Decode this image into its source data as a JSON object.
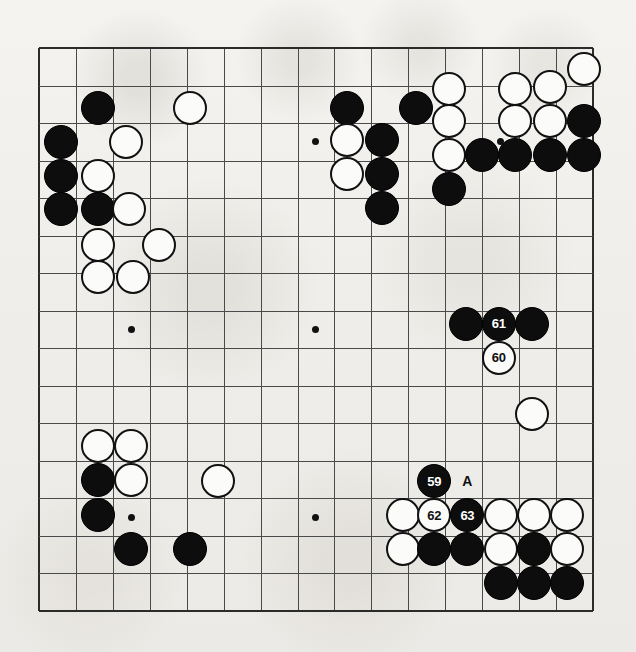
{
  "diagram": {
    "kind": "go-board-diagram",
    "board": {
      "cols": 16,
      "rows": 16,
      "origin_x": 39,
      "origin_y": 48,
      "step_x": 36.93,
      "step_y": 37.53,
      "stone_radius": 17,
      "line_color": "#4a4a4a",
      "edge_color": "#2b2b2b",
      "background": "#f2f1ee",
      "edges": {
        "left": true,
        "top": true,
        "right": true,
        "bottom": true
      }
    },
    "hoshi": [
      {
        "c": 2.5,
        "r": 2.5
      },
      {
        "c": 7.5,
        "r": 2.5
      },
      {
        "c": 2.5,
        "r": 7.5
      },
      {
        "c": 7.5,
        "r": 7.5
      },
      {
        "c": 12.5,
        "r": 2.5
      },
      {
        "c": 2.5,
        "r": 12.5
      },
      {
        "c": 7.5,
        "r": 12.5
      }
    ],
    "stones": [
      {
        "c": 1.6,
        "r": 1.6,
        "color": "black",
        "label": ""
      },
      {
        "c": 4.1,
        "r": 1.6,
        "color": "white",
        "label": ""
      },
      {
        "c": 0.6,
        "r": 2.5,
        "color": "black",
        "label": ""
      },
      {
        "c": 2.35,
        "r": 2.5,
        "color": "white",
        "label": ""
      },
      {
        "c": 0.6,
        "r": 3.4,
        "color": "black",
        "label": ""
      },
      {
        "c": 1.6,
        "r": 3.4,
        "color": "white",
        "label": ""
      },
      {
        "c": 0.6,
        "r": 4.3,
        "color": "black",
        "label": ""
      },
      {
        "c": 1.6,
        "r": 4.3,
        "color": "black",
        "label": ""
      },
      {
        "c": 2.45,
        "r": 4.3,
        "color": "white",
        "label": ""
      },
      {
        "c": 1.6,
        "r": 5.25,
        "color": "white",
        "label": ""
      },
      {
        "c": 3.25,
        "r": 5.25,
        "color": "white",
        "label": ""
      },
      {
        "c": 1.6,
        "r": 6.1,
        "color": "white",
        "label": ""
      },
      {
        "c": 2.55,
        "r": 6.1,
        "color": "white",
        "label": ""
      },
      {
        "c": 8.35,
        "r": 1.6,
        "color": "black",
        "label": ""
      },
      {
        "c": 10.2,
        "r": 1.6,
        "color": "black",
        "label": ""
      },
      {
        "c": 11.1,
        "r": 1.1,
        "color": "white",
        "label": ""
      },
      {
        "c": 12.9,
        "r": 1.1,
        "color": "white",
        "label": ""
      },
      {
        "c": 13.85,
        "r": 1.05,
        "color": "white",
        "label": ""
      },
      {
        "c": 14.75,
        "r": 0.55,
        "color": "white",
        "label": ""
      },
      {
        "c": 11.1,
        "r": 1.95,
        "color": "white",
        "label": ""
      },
      {
        "c": 12.9,
        "r": 1.95,
        "color": "white",
        "label": ""
      },
      {
        "c": 13.85,
        "r": 1.95,
        "color": "white",
        "label": ""
      },
      {
        "c": 14.75,
        "r": 1.95,
        "color": "black",
        "label": ""
      },
      {
        "c": 8.35,
        "r": 2.45,
        "color": "white",
        "label": ""
      },
      {
        "c": 9.3,
        "r": 2.45,
        "color": "black",
        "label": ""
      },
      {
        "c": 11.1,
        "r": 2.85,
        "color": "white",
        "label": ""
      },
      {
        "c": 12.0,
        "r": 2.85,
        "color": "black",
        "label": ""
      },
      {
        "c": 12.9,
        "r": 2.85,
        "color": "black",
        "label": ""
      },
      {
        "c": 13.85,
        "r": 2.85,
        "color": "black",
        "label": ""
      },
      {
        "c": 14.75,
        "r": 2.85,
        "color": "black",
        "label": ""
      },
      {
        "c": 8.35,
        "r": 3.35,
        "color": "white",
        "label": ""
      },
      {
        "c": 9.3,
        "r": 3.35,
        "color": "black",
        "label": ""
      },
      {
        "c": 11.1,
        "r": 3.75,
        "color": "black",
        "label": ""
      },
      {
        "c": 9.3,
        "r": 4.25,
        "color": "black",
        "label": ""
      },
      {
        "c": 11.55,
        "r": 7.35,
        "color": "black",
        "label": ""
      },
      {
        "c": 12.45,
        "r": 7.35,
        "color": "black",
        "label": "61"
      },
      {
        "c": 13.35,
        "r": 7.35,
        "color": "black",
        "label": ""
      },
      {
        "c": 12.45,
        "r": 8.25,
        "color": "white",
        "label": "60"
      },
      {
        "c": 13.35,
        "r": 9.75,
        "color": "white",
        "label": ""
      },
      {
        "c": 1.6,
        "r": 10.6,
        "color": "white",
        "label": ""
      },
      {
        "c": 2.5,
        "r": 10.6,
        "color": "white",
        "label": ""
      },
      {
        "c": 1.6,
        "r": 11.5,
        "color": "black",
        "label": ""
      },
      {
        "c": 2.5,
        "r": 11.5,
        "color": "white",
        "label": ""
      },
      {
        "c": 4.85,
        "r": 11.55,
        "color": "white",
        "label": ""
      },
      {
        "c": 1.6,
        "r": 12.45,
        "color": "black",
        "label": ""
      },
      {
        "c": 2.5,
        "r": 13.35,
        "color": "black",
        "label": ""
      },
      {
        "c": 4.1,
        "r": 13.35,
        "color": "black",
        "label": ""
      },
      {
        "c": 10.7,
        "r": 11.55,
        "color": "black",
        "label": "59"
      },
      {
        "c": 9.85,
        "r": 12.45,
        "color": "white",
        "label": ""
      },
      {
        "c": 10.7,
        "r": 12.45,
        "color": "white",
        "label": "62"
      },
      {
        "c": 11.6,
        "r": 12.45,
        "color": "black",
        "label": "63"
      },
      {
        "c": 12.5,
        "r": 12.45,
        "color": "white",
        "label": ""
      },
      {
        "c": 13.4,
        "r": 12.45,
        "color": "white",
        "label": ""
      },
      {
        "c": 14.3,
        "r": 12.45,
        "color": "white",
        "label": ""
      },
      {
        "c": 9.85,
        "r": 13.35,
        "color": "white",
        "label": ""
      },
      {
        "c": 10.7,
        "r": 13.35,
        "color": "black",
        "label": ""
      },
      {
        "c": 11.6,
        "r": 13.35,
        "color": "black",
        "label": ""
      },
      {
        "c": 12.5,
        "r": 13.35,
        "color": "white",
        "label": ""
      },
      {
        "c": 13.4,
        "r": 13.35,
        "color": "black",
        "label": ""
      },
      {
        "c": 14.3,
        "r": 13.35,
        "color": "white",
        "label": ""
      },
      {
        "c": 12.5,
        "r": 14.25,
        "color": "black",
        "label": ""
      },
      {
        "c": 13.4,
        "r": 14.25,
        "color": "black",
        "label": ""
      },
      {
        "c": 14.3,
        "r": 14.25,
        "color": "black",
        "label": ""
      }
    ],
    "markers": [
      {
        "c": 11.6,
        "r": 11.55,
        "text": "A"
      }
    ],
    "move_numbers": [
      "59",
      "60",
      "61",
      "62",
      "63"
    ]
  }
}
